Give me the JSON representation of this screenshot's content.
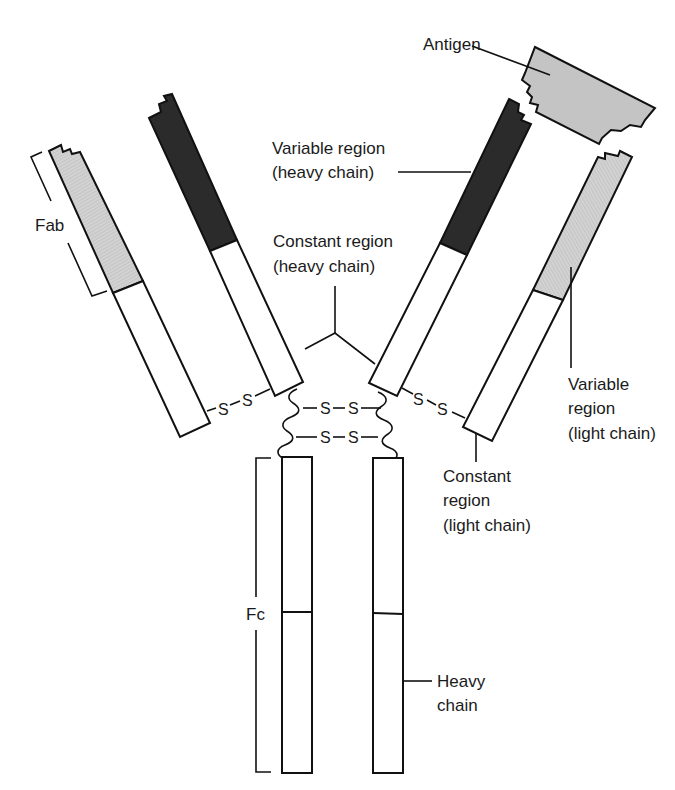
{
  "colors": {
    "variable_heavy": "#2b2b2b",
    "variable_light": "#cfcfcf",
    "antigen": "#c4c4c4",
    "constant": "#ffffff",
    "stroke": "#111111"
  },
  "labels": {
    "antigen": "Antigen",
    "variable_heavy": [
      "Variable region",
      "(heavy chain)"
    ],
    "constant_heavy": [
      "Constant region",
      "(heavy chain)"
    ],
    "fab": "Fab",
    "fc": "Fc",
    "variable_light": [
      "Variable",
      "region",
      "(light chain)"
    ],
    "constant_light": [
      "Constant",
      "region",
      "(light chain)"
    ],
    "heavy_chain": [
      "Heavy",
      "chain"
    ]
  },
  "disulfide_bonds": {
    "left_hinge": [
      "S",
      "S"
    ],
    "right_hinge": [
      "S",
      "S"
    ],
    "center_upper": [
      "S",
      "S"
    ],
    "center_lower": [
      "S",
      "S"
    ]
  }
}
